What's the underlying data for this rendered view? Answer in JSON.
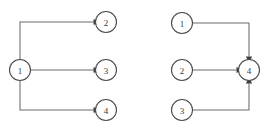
{
  "figure": {
    "background_color": "#ffffff",
    "node_stroke_color": "#4a4a4a",
    "node_fill_color": "#ffffff",
    "edge_color": "#6b6b6b",
    "arrow_color": "#3f3f3f",
    "label_color": "#3a3a3a"
  },
  "diagrams": [
    {
      "id": "left-diagram",
      "name": "fan-out-graph",
      "nodes": [
        {
          "id": "L1",
          "label": "1",
          "cx": 20,
          "cy": 70,
          "r": 10.5
        },
        {
          "id": "L2",
          "label": "2",
          "cx": 106,
          "cy": 22,
          "r": 10.5
        },
        {
          "id": "L3",
          "label": "3",
          "cx": 106,
          "cy": 70,
          "r": 10.5
        },
        {
          "id": "L4",
          "label": "4",
          "cx": 106,
          "cy": 110,
          "r": 10.5
        }
      ],
      "edges": [
        {
          "id": "L1-L2",
          "from": "1",
          "to": "2",
          "path": "M20,59.5 L20,22 L93.5,22",
          "arrow": {
            "x": 93.5,
            "y": 22,
            "dir": "right"
          }
        },
        {
          "id": "L1-L3",
          "from": "1",
          "to": "3",
          "path": "M30.5,70 L93.5,70",
          "arrow": {
            "x": 93.5,
            "y": 70,
            "dir": "right"
          }
        },
        {
          "id": "L1-L4",
          "from": "1",
          "to": "4",
          "path": "M20,80.5 L20,110 L93.5,110",
          "arrow": {
            "x": 93.5,
            "y": 110,
            "dir": "right"
          }
        }
      ]
    },
    {
      "id": "right-diagram",
      "name": "fan-in-graph",
      "nodes": [
        {
          "id": "R1",
          "label": "1",
          "cx": 182,
          "cy": 23,
          "r": 10.5
        },
        {
          "id": "R2",
          "label": "2",
          "cx": 182,
          "cy": 70,
          "r": 10.5
        },
        {
          "id": "R3",
          "label": "3",
          "cx": 182,
          "cy": 110,
          "r": 10.5
        },
        {
          "id": "R4",
          "label": "4",
          "cx": 249,
          "cy": 70,
          "r": 10.5
        }
      ],
      "edges": [
        {
          "id": "R1-R4",
          "from": "1",
          "to": "4",
          "path": "M192.5,23 L249,23 L249,56.5",
          "arrow": {
            "x": 249,
            "y": 56.5,
            "dir": "down"
          }
        },
        {
          "id": "R2-R4",
          "from": "2",
          "to": "4",
          "path": "M192.5,70 L236.5,70",
          "arrow": {
            "x": 236.5,
            "y": 70,
            "dir": "right"
          }
        },
        {
          "id": "R3-R4",
          "from": "3",
          "to": "4",
          "path": "M192.5,110 L249,110 L249,83.5",
          "arrow": {
            "x": 249,
            "y": 83.5,
            "dir": "up"
          }
        }
      ]
    }
  ]
}
